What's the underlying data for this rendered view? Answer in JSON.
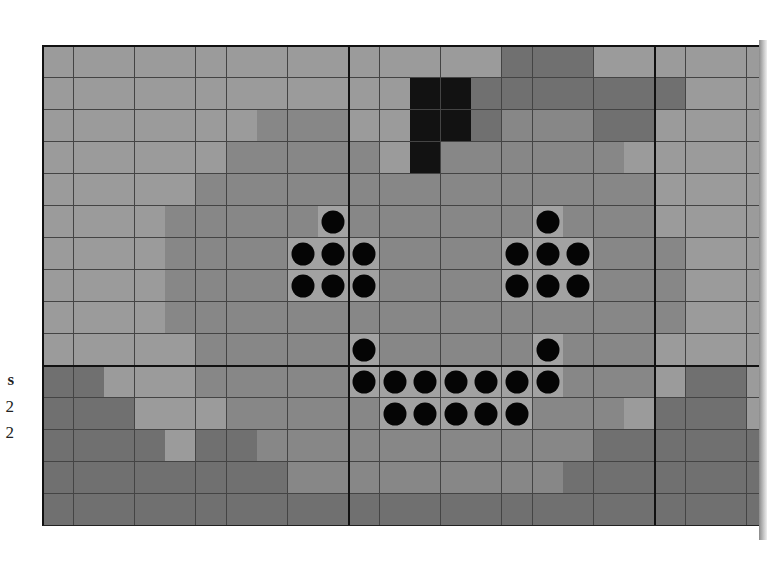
{
  "side_labels": [
    {
      "text": "s",
      "bold": true,
      "top": 370
    },
    {
      "text": "2",
      "bold": false,
      "top": 397
    },
    {
      "text": "2",
      "bold": false,
      "top": 423
    }
  ],
  "board": {
    "cols": 24,
    "rows": 15,
    "cell_width": 30.6,
    "cell_height": 32,
    "thick_vertical_after_cols": [
      10,
      20
    ],
    "thick_horizontal_after_rows": [
      10
    ],
    "colors": {
      "L": "#9b9b9b",
      "M": "#878787",
      "VD": "#707070",
      "BK": "#121212",
      "P": "#a2a2a2",
      "dot": "#050505"
    },
    "cells": [
      [
        "L",
        "L",
        "L",
        "L",
        "L",
        "L",
        "L",
        "L",
        "L",
        "L",
        "L",
        "L",
        "L",
        "L",
        "L",
        "VD",
        "VD",
        "VD",
        "L",
        "L",
        "L",
        "L",
        "L",
        "L"
      ],
      [
        "L",
        "L",
        "L",
        "L",
        "L",
        "L",
        "L",
        "L",
        "L",
        "L",
        "L",
        "L",
        "BK",
        "BK",
        "VD",
        "VD",
        "VD",
        "VD",
        "VD",
        "VD",
        "VD",
        "L",
        "L",
        "L"
      ],
      [
        "L",
        "L",
        "L",
        "L",
        "L",
        "L",
        "L",
        "M",
        "M",
        "M",
        "L",
        "L",
        "BK",
        "BK",
        "VD",
        "M",
        "M",
        "M",
        "VD",
        "VD",
        "L",
        "L",
        "L",
        "L"
      ],
      [
        "L",
        "L",
        "L",
        "L",
        "L",
        "L",
        "M",
        "M",
        "M",
        "M",
        "M",
        "L",
        "BK",
        "M",
        "M",
        "M",
        "M",
        "M",
        "M",
        "L",
        "L",
        "L",
        "L",
        "L"
      ],
      [
        "L",
        "L",
        "L",
        "L",
        "L",
        "M",
        "M",
        "M",
        "M",
        "M",
        "M",
        "M",
        "M",
        "M",
        "M",
        "M",
        "M",
        "M",
        "M",
        "M",
        "L",
        "L",
        "L",
        "L"
      ],
      [
        "L",
        "L",
        "L",
        "L",
        "M",
        "M",
        "M",
        "M",
        "M",
        "P",
        "M",
        "M",
        "M",
        "M",
        "M",
        "M",
        "P",
        "M",
        "M",
        "M",
        "L",
        "L",
        "L",
        "L"
      ],
      [
        "L",
        "L",
        "L",
        "L",
        "M",
        "M",
        "M",
        "M",
        "P",
        "P",
        "P",
        "M",
        "M",
        "M",
        "M",
        "P",
        "P",
        "P",
        "M",
        "M",
        "M",
        "L",
        "L",
        "L"
      ],
      [
        "L",
        "L",
        "L",
        "L",
        "M",
        "M",
        "M",
        "M",
        "P",
        "P",
        "P",
        "M",
        "M",
        "M",
        "M",
        "P",
        "P",
        "P",
        "M",
        "M",
        "M",
        "L",
        "L",
        "L"
      ],
      [
        "L",
        "L",
        "L",
        "L",
        "M",
        "M",
        "M",
        "M",
        "M",
        "M",
        "M",
        "M",
        "M",
        "M",
        "M",
        "M",
        "M",
        "M",
        "M",
        "M",
        "M",
        "L",
        "L",
        "L"
      ],
      [
        "L",
        "L",
        "L",
        "L",
        "L",
        "M",
        "M",
        "M",
        "M",
        "M",
        "P",
        "M",
        "M",
        "M",
        "M",
        "M",
        "P",
        "M",
        "M",
        "M",
        "L",
        "L",
        "L",
        "L"
      ],
      [
        "VD",
        "VD",
        "L",
        "L",
        "L",
        "M",
        "M",
        "M",
        "M",
        "M",
        "P",
        "P",
        "P",
        "P",
        "P",
        "P",
        "P",
        "M",
        "M",
        "M",
        "L",
        "VD",
        "VD",
        "L"
      ],
      [
        "VD",
        "VD",
        "VD",
        "L",
        "L",
        "L",
        "M",
        "M",
        "M",
        "M",
        "M",
        "P",
        "P",
        "P",
        "P",
        "P",
        "M",
        "M",
        "M",
        "L",
        "VD",
        "VD",
        "VD",
        "L"
      ],
      [
        "VD",
        "VD",
        "VD",
        "VD",
        "L",
        "VD",
        "VD",
        "M",
        "M",
        "M",
        "M",
        "M",
        "M",
        "M",
        "M",
        "M",
        "M",
        "M",
        "VD",
        "VD",
        "VD",
        "VD",
        "VD",
        "VD"
      ],
      [
        "VD",
        "VD",
        "VD",
        "VD",
        "VD",
        "VD",
        "VD",
        "VD",
        "M",
        "M",
        "M",
        "M",
        "M",
        "M",
        "M",
        "M",
        "M",
        "VD",
        "VD",
        "VD",
        "VD",
        "VD",
        "VD",
        "VD"
      ],
      [
        "VD",
        "VD",
        "VD",
        "VD",
        "VD",
        "VD",
        "VD",
        "VD",
        "VD",
        "VD",
        "VD",
        "VD",
        "VD",
        "VD",
        "VD",
        "VD",
        "VD",
        "VD",
        "VD",
        "VD",
        "VD",
        "VD",
        "VD",
        "VD"
      ]
    ],
    "dots": [
      [
        5,
        9
      ],
      [
        5,
        16
      ],
      [
        6,
        8
      ],
      [
        6,
        9
      ],
      [
        6,
        10
      ],
      [
        6,
        15
      ],
      [
        6,
        16
      ],
      [
        6,
        17
      ],
      [
        7,
        8
      ],
      [
        7,
        9
      ],
      [
        7,
        10
      ],
      [
        7,
        15
      ],
      [
        7,
        16
      ],
      [
        7,
        17
      ],
      [
        9,
        10
      ],
      [
        9,
        16
      ],
      [
        10,
        10
      ],
      [
        10,
        11
      ],
      [
        10,
        12
      ],
      [
        10,
        13
      ],
      [
        10,
        14
      ],
      [
        10,
        15
      ],
      [
        10,
        16
      ],
      [
        11,
        11
      ],
      [
        11,
        12
      ],
      [
        11,
        13
      ],
      [
        11,
        14
      ],
      [
        11,
        15
      ]
    ]
  }
}
